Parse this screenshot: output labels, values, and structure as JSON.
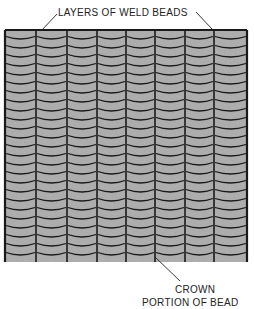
{
  "labels": {
    "top": "LAYERS OF WELD BEADS",
    "bottom_line1": "CROWN",
    "bottom_line2": "PORTION OF BEAD"
  },
  "panel": {
    "x": 5,
    "y": 30,
    "width": 242,
    "height": 232,
    "columns": 8,
    "row_height": 9,
    "column_edges": [
      5,
      36,
      67,
      97,
      126,
      155,
      185,
      214,
      247
    ],
    "fill": "#a8a8a8",
    "line": "#1a1a1a"
  }
}
